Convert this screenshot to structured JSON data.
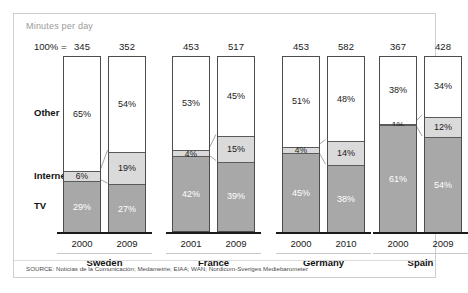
{
  "title": "Minutes per day",
  "pct_equals_label": "100% =",
  "source": "SOURCE: Noticias de la Comunicación; Medametrie; EIAA; WAN; Nordicom-Sveriges Mediebarometer",
  "colors": {
    "other": "#ffffff",
    "internet": "#dadada",
    "tv": "#a8a8a8",
    "outline": "#4d4d4d",
    "frame": "#cfcfcf",
    "title_text": "#9a9a9a"
  },
  "category_labels": [
    "Other",
    "Internet",
    "TV"
  ],
  "chart_data": {
    "type": "bar",
    "subtype": "stacked-100-percent",
    "title": "Minutes per day",
    "xlabel": "",
    "ylabel": "",
    "ylim": [
      0,
      100
    ],
    "grid": false,
    "legend_position": "left-axis-labels",
    "categories": [
      "Other",
      "Internet",
      "TV"
    ],
    "groups": [
      {
        "name": "Sweden",
        "bars": [
          {
            "year": "2000",
            "total": "345",
            "other": 65,
            "internet": 6,
            "tv": 29,
            "other_label": "65%",
            "internet_label": "6%",
            "tv_label": "29%"
          },
          {
            "year": "2009",
            "total": "352",
            "other": 54,
            "internet": 19,
            "tv": 27,
            "other_label": "54%",
            "internet_label": "19%",
            "tv_label": "27%"
          }
        ]
      },
      {
        "name": "France",
        "bars": [
          {
            "year": "2001",
            "total": "453",
            "other": 53,
            "internet": 4,
            "tv": 42,
            "other_label": "53%",
            "internet_label": "4%",
            "tv_label": "42%"
          },
          {
            "year": "2009",
            "total": "517",
            "other": 45,
            "internet": 15,
            "tv": 39,
            "other_label": "45%",
            "internet_label": "15%",
            "tv_label": "39%"
          }
        ]
      },
      {
        "name": "Germany",
        "bars": [
          {
            "year": "2000",
            "total": "453",
            "other": 51,
            "internet": 4,
            "tv": 45,
            "other_label": "51%",
            "internet_label": "4%",
            "tv_label": "45%"
          },
          {
            "year": "2010",
            "total": "582",
            "other": 48,
            "internet": 14,
            "tv": 38,
            "other_label": "48%",
            "internet_label": "14%",
            "tv_label": "38%"
          }
        ]
      },
      {
        "name": "Spain",
        "bars": [
          {
            "year": "2000",
            "total": "367",
            "other": 38,
            "internet": 1,
            "tv": 61,
            "other_label": "38%",
            "internet_label": "1%",
            "tv_label": "61%"
          },
          {
            "year": "2009",
            "total": "428",
            "other": 34,
            "internet": 12,
            "tv": 54,
            "other_label": "34%",
            "internet_label": "12%",
            "tv_label": "54%"
          }
        ]
      }
    ]
  }
}
